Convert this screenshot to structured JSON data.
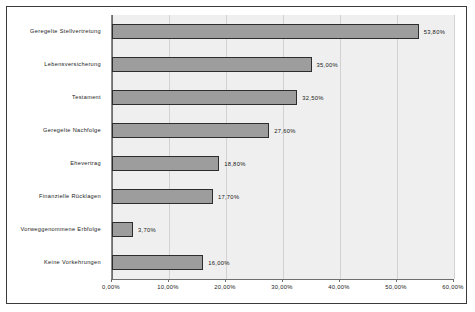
{
  "chart_data": {
    "type": "bar",
    "orientation": "horizontal",
    "title": "",
    "subtitle": "",
    "xlabel": "",
    "ylabel": "",
    "categories": [
      "Geregelte Stellvertretung",
      "Lebensversicherung",
      "Testament",
      "Geregelte Nachfolge",
      "Ehevertrag",
      "Finanzielle Rücklagen",
      "Vorweggenommene Erbfolge",
      "Keine Vorkehrungen"
    ],
    "values": [
      53.8,
      35.0,
      32.5,
      27.6,
      18.8,
      17.7,
      3.7,
      16.0
    ],
    "value_labels": [
      "53,80%",
      "35,00%",
      "32,50%",
      "27,60%",
      "18,80%",
      "17,70%",
      "3,70%",
      "16,00%"
    ],
    "xlim": [
      0,
      60
    ],
    "xticks": [
      0,
      10,
      20,
      30,
      40,
      50,
      60
    ],
    "xtick_labels": [
      "0,00%",
      "10,00%",
      "20,00%",
      "30,00%",
      "40,00%",
      "50,00%",
      "60,00%"
    ],
    "grid": true,
    "grid_axis": "x",
    "legend": false,
    "legend_position": "none",
    "colors": {
      "bar_fill": "#9d9d9d",
      "bar_border": "#2d2d2d",
      "plot_background": "#efefef",
      "grid_line": "#d2d2d2",
      "axis_line": "#6e6e6e",
      "frame_border": "#3a3a3a",
      "text": "#1a1a1a",
      "page_background": "#ffffff"
    }
  }
}
